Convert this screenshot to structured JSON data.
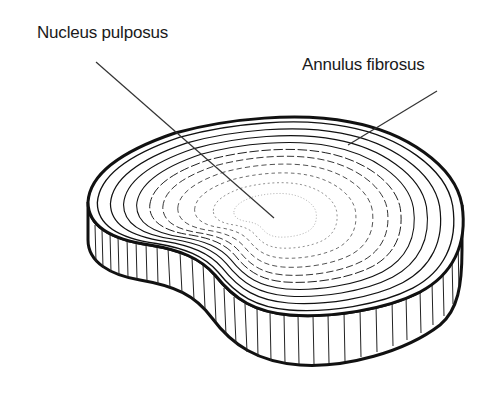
{
  "diagram": {
    "labels": [
      {
        "id": "nucleus",
        "text": "Nucleus pulposus",
        "pointer_from": [
          96,
          62
        ],
        "pointer_to": [
          274,
          218
        ]
      },
      {
        "id": "annulus",
        "text": "Annulus fibrosus",
        "pointer_from": [
          437,
          91
        ],
        "pointer_to": [
          348,
          145
        ]
      }
    ],
    "colors": {
      "ink": "#111111",
      "background": "#ffffff"
    }
  }
}
